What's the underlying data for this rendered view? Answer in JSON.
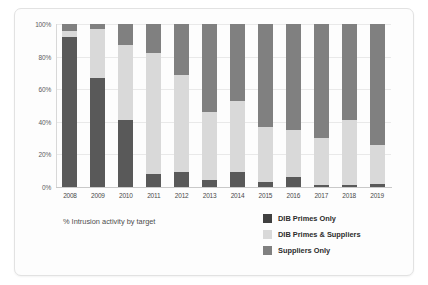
{
  "figure": {
    "caption": "% Intrusion activity by target"
  },
  "colors": {
    "dib_primes_only": "#595959",
    "dib_primes_and_suppliers": "#d9d9d9",
    "suppliers_only": "#808080",
    "gridline": "#e9e9e9",
    "axis": "#c9c9c9",
    "background": "#fdfdfd"
  },
  "legend": {
    "position": "bottom-right",
    "items": [
      {
        "label": "DIB Primes Only",
        "color": "#404040"
      },
      {
        "label": "DIB Primes & Suppliers",
        "color": "#d9d9d9"
      },
      {
        "label": "Suppliers Only",
        "color": "#808080"
      }
    ]
  },
  "chart_data": {
    "type": "bar",
    "stacked": true,
    "stack_mode": "percent",
    "title": "",
    "subtitle": "",
    "xlabel": "",
    "ylabel": "",
    "caption": "% Intrusion activity by target",
    "grid": true,
    "ylim": [
      0,
      100
    ],
    "yticks": [
      0,
      20,
      40,
      60,
      80,
      100
    ],
    "ytick_labels": [
      "0%",
      "20%",
      "40%",
      "60%",
      "80%",
      "100%"
    ],
    "categories": [
      "2008",
      "2009",
      "2010",
      "2011",
      "2012",
      "2013",
      "2014",
      "2015",
      "2016",
      "2017",
      "2018",
      "2019"
    ],
    "series": [
      {
        "name": "DIB Primes Only",
        "color": "#595959",
        "values": [
          92,
          67,
          41,
          8,
          9,
          4,
          9,
          3,
          6,
          1,
          1,
          2
        ]
      },
      {
        "name": "DIB Primes & Suppliers",
        "color": "#d9d9d9",
        "values": [
          4,
          30,
          46,
          74,
          60,
          42,
          44,
          34,
          29,
          29,
          40,
          24
        ]
      },
      {
        "name": "Suppliers Only",
        "color": "#808080",
        "values": [
          4,
          3,
          13,
          18,
          31,
          54,
          47,
          63,
          65,
          70,
          59,
          74
        ]
      }
    ]
  }
}
